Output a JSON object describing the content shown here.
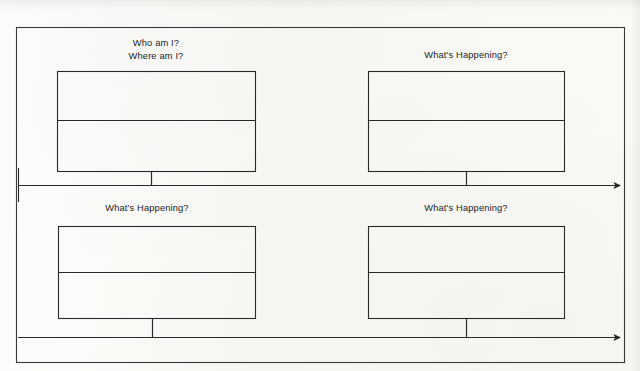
{
  "document": {
    "type": "storyboard-timeline-worksheet",
    "background_color": "#fbfbf9",
    "ink_color": "#2a2a2a",
    "border": {
      "name": "outer-page-border",
      "x": 16,
      "y": 27,
      "width": 608,
      "height": 335
    }
  },
  "timelines": [
    {
      "id": "timeline-top",
      "label": "top-timeline-arrow",
      "y": 185,
      "x_start": 18,
      "x_end": 620,
      "arrowhead": "right",
      "start_tick": true
    },
    {
      "id": "timeline-bottom",
      "label": "bottom-timeline-arrow",
      "y": 337,
      "x_start": 18,
      "x_end": 620,
      "arrowhead": "right",
      "start_tick": false
    }
  ],
  "panels": [
    {
      "id": "panel-1",
      "name": "panel-top-left",
      "prompt_lines": [
        "Who am I?",
        "Where am I?"
      ],
      "label_center_x": 156,
      "label_top_y": 37,
      "box": {
        "x": 57,
        "y": 71,
        "width": 198,
        "height": 100
      },
      "divider_offset_y": 49,
      "stem": {
        "x": 151,
        "y_from": 171,
        "y_to": 185
      }
    },
    {
      "id": "panel-2",
      "name": "panel-top-right",
      "prompt_lines": [
        "What's Happening?"
      ],
      "label_center_x": 466,
      "label_top_y": 49,
      "box": {
        "x": 368,
        "y": 71,
        "width": 196,
        "height": 100
      },
      "divider_offset_y": 49,
      "stem": {
        "x": 466,
        "y_from": 171,
        "y_to": 185
      }
    },
    {
      "id": "panel-3",
      "name": "panel-bottom-left",
      "prompt_lines": [
        "What's Happening?"
      ],
      "label_center_x": 147,
      "label_top_y": 202,
      "box": {
        "x": 58,
        "y": 226,
        "width": 197,
        "height": 92
      },
      "divider_offset_y": 46,
      "stem": {
        "x": 152,
        "y_from": 318,
        "y_to": 337
      }
    },
    {
      "id": "panel-4",
      "name": "panel-bottom-right",
      "prompt_lines": [
        "What's Happening?"
      ],
      "label_center_x": 466,
      "label_top_y": 202,
      "box": {
        "x": 368,
        "y": 226,
        "width": 196,
        "height": 92
      },
      "divider_offset_y": 46,
      "stem": {
        "x": 466,
        "y_from": 318,
        "y_to": 337
      }
    }
  ]
}
